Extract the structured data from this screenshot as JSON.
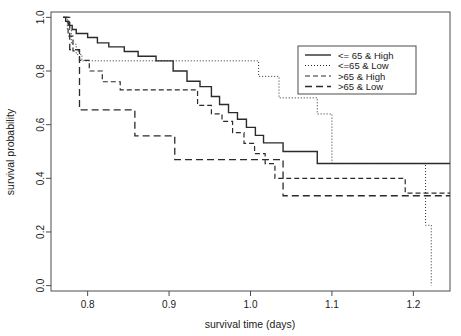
{
  "chart_data": {
    "type": "line",
    "subtype": "kaplan-meier-step",
    "title": "",
    "xlabel": "survival time (days)",
    "ylabel": "survival probability",
    "xlim": [
      0.755,
      1.245
    ],
    "ylim": [
      -0.02,
      1.02
    ],
    "xticks": [
      0.8,
      0.9,
      1.0,
      1.1,
      1.2
    ],
    "xtick_labels": [
      "0.8",
      "0.9",
      "1.0",
      "1.1",
      "1.2"
    ],
    "yticks": [
      0.0,
      0.2,
      0.4,
      0.6,
      0.8,
      1.0
    ],
    "ytick_labels": [
      "0.0",
      "0.2",
      "0.4",
      "0.6",
      "0.8",
      "1.0"
    ],
    "grid": false,
    "legend_position": "top-right",
    "series": [
      {
        "name": "<= 65 & High",
        "linestyle": "solid",
        "linewidth": 1.4,
        "x": [
          0.77,
          0.773,
          0.777,
          0.781,
          0.786,
          0.8,
          0.812,
          0.826,
          0.845,
          0.862,
          0.884,
          0.905,
          0.922,
          0.938,
          0.952,
          0.962,
          0.973,
          0.984,
          0.995,
          1.006,
          1.016,
          1.04,
          1.082,
          1.245
        ],
        "y": [
          1.0,
          0.985,
          0.97,
          0.955,
          0.94,
          0.925,
          0.905,
          0.89,
          0.873,
          0.855,
          0.838,
          0.8,
          0.762,
          0.742,
          0.705,
          0.675,
          0.645,
          0.62,
          0.59,
          0.56,
          0.532,
          0.5,
          0.455,
          0.455
        ]
      },
      {
        "name": "<=65 & Low",
        "linestyle": "dotted",
        "linewidth": 1.0,
        "x": [
          0.77,
          0.775,
          0.78,
          0.786,
          0.793,
          0.98,
          1.01,
          1.035,
          1.082,
          1.1,
          1.205,
          1.215,
          1.222
        ],
        "y": [
          1.0,
          0.955,
          0.9,
          0.862,
          0.838,
          0.838,
          0.78,
          0.7,
          0.64,
          0.455,
          0.455,
          0.225,
          0.0
        ]
      },
      {
        "name": ">65 & High",
        "linestyle": "dashdot",
        "linewidth": 1.2,
        "x": [
          0.77,
          0.776,
          0.782,
          0.79,
          0.802,
          0.818,
          0.84,
          0.896,
          0.935,
          0.952,
          0.965,
          0.978,
          0.992,
          1.005,
          1.018,
          1.03,
          1.175,
          1.19,
          1.245
        ],
        "y": [
          1.0,
          0.93,
          0.875,
          0.84,
          0.8,
          0.76,
          0.73,
          0.73,
          0.672,
          0.64,
          0.612,
          0.57,
          0.53,
          0.492,
          0.455,
          0.4,
          0.4,
          0.345,
          0.345
        ]
      },
      {
        "name": ">65 & Low",
        "linestyle": "dashed",
        "linewidth": 1.3,
        "x": [
          0.77,
          0.778,
          0.79,
          0.832,
          0.858,
          0.88,
          0.907,
          1.04,
          1.245
        ],
        "y": [
          1.0,
          0.88,
          0.655,
          0.655,
          0.558,
          0.558,
          0.47,
          0.335,
          0.335
        ]
      }
    ]
  },
  "legend": {
    "items": [
      {
        "label": "<= 65 & High",
        "style": "solid"
      },
      {
        "label": "<=65 & Low",
        "style": "dotted"
      },
      {
        "label": ">65 & High",
        "style": "dashdot"
      },
      {
        "label": ">65 & Low",
        "style": "dashed"
      }
    ]
  },
  "colors": {
    "line": "#2b2b2b",
    "frame": "#4d4d4d",
    "background": "#ffffff",
    "text": "#1a1a1a"
  }
}
